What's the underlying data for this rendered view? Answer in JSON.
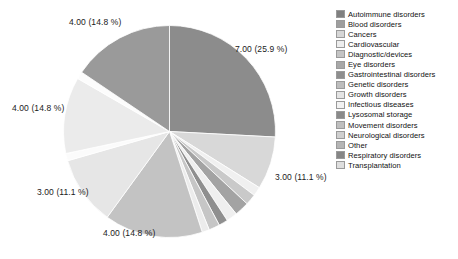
{
  "chart_data": {
    "type": "pie",
    "title": "",
    "categories": [
      "Autoimmune disorders",
      "Blood disorders",
      "Cancers",
      "Cardiovascular",
      "Diagnostic/devices",
      "Eye disorders",
      "Gastrointestinal disorders",
      "Genetic disorders",
      "Growth disorders",
      "Infectious diseases",
      "Lysosomal storage",
      "Movement disorders",
      "Neurological disorders",
      "Other",
      "Respiratory disorders",
      "Transplantation"
    ],
    "values": [
      7.0,
      3.0,
      0.4,
      0.4,
      1.0,
      0.6,
      1.0,
      4.0,
      3.0,
      4.0,
      4.0,
      0.4,
      0.4,
      0.4,
      0.4,
      0.4
    ],
    "labels_shown": [
      {
        "text": "7.00 (25.9 %)",
        "value": 7.0,
        "percent": 25.9
      },
      {
        "text": "3.00 (11.1 %)",
        "value": 3.0,
        "percent": 11.1
      },
      {
        "text": "4.00 (14.8 %)",
        "value": 4.0,
        "percent": 14.8
      },
      {
        "text": "3.00 (11.1 %)",
        "value": 3.0,
        "percent": 11.1
      },
      {
        "text": "4.00 (14.8 %)",
        "value": 4.0,
        "percent": 14.8
      },
      {
        "text": "4.00 (14.8 %)",
        "value": 4.0,
        "percent": 14.8
      }
    ],
    "xlabel": "",
    "ylabel": "",
    "legend_position": "right",
    "grid": false
  },
  "slice_labels": {
    "top_right": "7.00 (25.9 %)",
    "right": "3.00 (11.1 %)",
    "bottom": "4.00 (14.8 %)",
    "lower_left": "3.00 (11.1 %)",
    "left": "4.00 (14.8 %)",
    "top_left": "4.00 (14.8 %)"
  },
  "legend": {
    "items": [
      {
        "label": "Autoimmune disorders",
        "color": "#808080"
      },
      {
        "label": "Blood disorders",
        "color": "#9e9e9e"
      },
      {
        "label": "Cancers",
        "color": "#d6d6d6"
      },
      {
        "label": "Cardiovascular",
        "color": "#ededed"
      },
      {
        "label": "Diagnostic/devices",
        "color": "#c4c4c4"
      },
      {
        "label": "Eye disorders",
        "color": "#a8a8a8"
      },
      {
        "label": "Gastrointestinal disorders",
        "color": "#8e8e8e"
      },
      {
        "label": "Genetic disorders",
        "color": "#bdbdbd"
      },
      {
        "label": "Growth disorders",
        "color": "#e4e4e4"
      },
      {
        "label": "Infectious diseases",
        "color": "#f2f2f2"
      },
      {
        "label": "Lysosomal storage",
        "color": "#8a8a8a"
      },
      {
        "label": "Movement disorders",
        "color": "#bfbfbf"
      },
      {
        "label": "Neurological disorders",
        "color": "#cfcfcf"
      },
      {
        "label": "Other",
        "color": "#b5b5b5"
      },
      {
        "label": "Respiratory disorders",
        "color": "#868686"
      },
      {
        "label": "Transplantation",
        "color": "#dedede"
      }
    ]
  },
  "pie_geometry": {
    "cx": 107.5,
    "cy": 107.5,
    "r": 106,
    "slices": [
      {
        "name": "Autoimmune disorders",
        "start": 0,
        "end": 93,
        "color": "#8c8c8c"
      },
      {
        "name": "Blood disorders",
        "start": 93,
        "end": 122,
        "color": "#d8d8d8"
      },
      {
        "name": "Cancers",
        "start": 122,
        "end": 127,
        "color": "#f0f0f0"
      },
      {
        "name": "Cardiovascular",
        "start": 127,
        "end": 133,
        "color": "#c9c9c9"
      },
      {
        "name": "Diagnostic/devices",
        "start": 133,
        "end": 141,
        "color": "#a3a3a3"
      },
      {
        "name": "Eye disorders",
        "start": 141,
        "end": 147,
        "color": "#efefef"
      },
      {
        "name": "Gastrointestinal disorders",
        "start": 147,
        "end": 152,
        "color": "#8f8f8f"
      },
      {
        "name": "Genetic disorders",
        "start": 152,
        "end": 158,
        "color": "#c6c6c6"
      },
      {
        "name": "Growth disorders",
        "start": 158,
        "end": 162,
        "color": "#ececec"
      },
      {
        "name": "Infectious diseases",
        "start": 162,
        "end": 216,
        "color": "#c3c3c3"
      },
      {
        "name": "Lysosomal storage",
        "start": 216,
        "end": 254,
        "color": "#e6e6e6"
      },
      {
        "name": "Movement disorders",
        "start": 254,
        "end": 258,
        "color": "#fbfbfb"
      },
      {
        "name": "Neurological disorders",
        "start": 258,
        "end": 300,
        "color": "#ebebeb"
      },
      {
        "name": "Other",
        "start": 300,
        "end": 304,
        "color": "#fcfcfc"
      },
      {
        "name": "Respiratory disorders",
        "start": 304,
        "end": 360,
        "color": "#9a9a9a"
      }
    ]
  }
}
